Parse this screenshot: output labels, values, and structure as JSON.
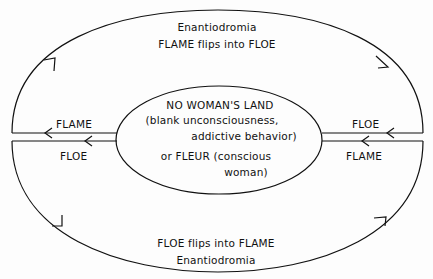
{
  "diagram": {
    "top_arc": {
      "title": "Enantiodromia",
      "subtitle": "FLAME flips into FLOE"
    },
    "bottom_arc": {
      "subtitle": "FLOE flips into FLAME",
      "title": "Enantiodromia"
    },
    "center": {
      "line1": "NO WOMAN'S LAND",
      "line2": "(blank unconsciousness,",
      "line3": "addictive behavior)",
      "line4": "or FLEUR (conscious",
      "line5": "woman)"
    },
    "left": {
      "upper_label": "FLAME",
      "lower_label": "FLOE"
    },
    "right": {
      "upper_label": "FLOE",
      "lower_label": "FLAME"
    },
    "colors": {
      "line": "#111111",
      "background": "#fdfdfd"
    }
  }
}
